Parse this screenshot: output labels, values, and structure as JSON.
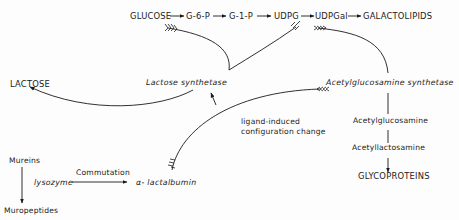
{
  "diagram": {
    "top_pathway": {
      "nodes": [
        "GLUCOSE",
        "G-6-P",
        "G-1-P",
        "UDPG",
        "UDPGal",
        "GALACTOLIPIDS"
      ]
    },
    "enzymes": {
      "lactose_synthetase": "Lactose synthetase",
      "acetylglucosamine_synthetase": "Acetylglucosamine synthetase",
      "lysozyme": "lysozyme",
      "alpha_lactalbumin": "α- lactalbumin"
    },
    "products": {
      "lactose": "LACTOSE",
      "acetylglucosamine": "Acetylglucosamine",
      "acetyllactosamine": "Acetyllactosamine",
      "glycoproteins": "GLYCOPROTEINS",
      "mureins": "Mureins",
      "muropeptides": "Muropeptides"
    },
    "annotations": {
      "ligand_line1": "ligand-induced",
      "ligand_line2": "configuration change",
      "commutation": "Commutation"
    },
    "colors": {
      "ink": "#1a1a1a",
      "background": "#fdfdfd"
    }
  }
}
